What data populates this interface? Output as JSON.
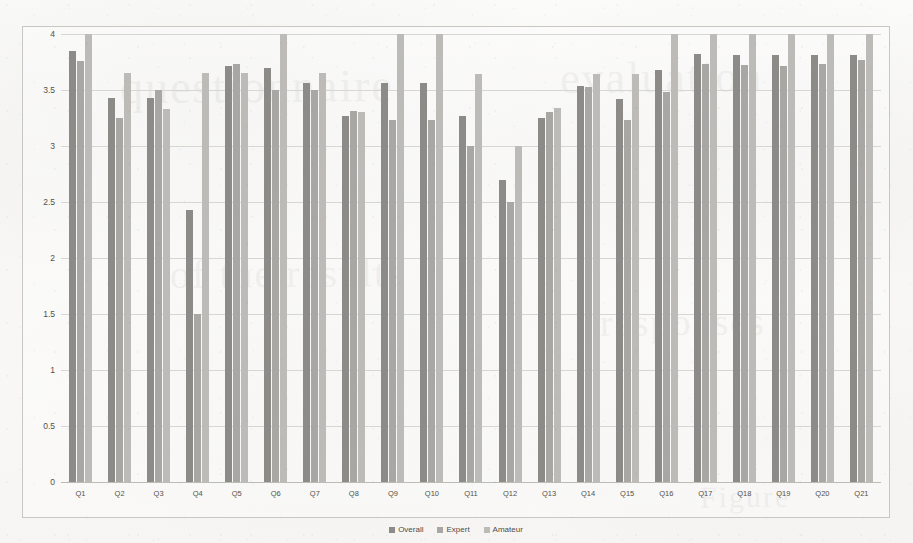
{
  "chart_data": {
    "type": "bar",
    "title": "",
    "xlabel": "",
    "ylabel": "",
    "ylim": [
      0,
      4
    ],
    "ytick_values": [
      0,
      0.5,
      1,
      1.5,
      2,
      2.5,
      3,
      3.5,
      4
    ],
    "ytick_labels": [
      "0",
      "0.5",
      "1",
      "1.5",
      "2",
      "2.5",
      "3",
      "3.5",
      "4"
    ],
    "grid": true,
    "legend_position": "bottom-center",
    "categories": [
      "Q1",
      "Q2",
      "Q3",
      "Q4",
      "Q5",
      "Q6",
      "Q7",
      "Q8",
      "Q9",
      "Q10",
      "Q11",
      "Q12",
      "Q13",
      "Q14",
      "Q15",
      "Q16",
      "Q17",
      "Q18",
      "Q19",
      "Q20",
      "Q21"
    ],
    "series": [
      {
        "name": "Overall",
        "color": "#8d8b88",
        "values": [
          3.85,
          3.43,
          3.43,
          2.43,
          3.71,
          3.7,
          3.56,
          3.27,
          3.56,
          3.56,
          3.27,
          2.7,
          3.25,
          3.54,
          3.42,
          3.68,
          3.82,
          3.81,
          3.81,
          3.81,
          3.81
        ]
      },
      {
        "name": "Expert",
        "color": "#a9a7a3",
        "values": [
          3.76,
          3.25,
          3.5,
          1.5,
          3.73,
          3.5,
          3.5,
          3.31,
          3.23,
          3.23,
          3.0,
          2.5,
          3.3,
          3.53,
          3.23,
          3.48,
          3.73,
          3.72,
          3.71,
          3.73,
          3.77
        ]
      },
      {
        "name": "Amateur",
        "color": "#bdbbb7",
        "values": [
          4.0,
          3.65,
          3.33,
          3.65,
          3.65,
          4.0,
          3.65,
          3.3,
          4.0,
          4.0,
          3.64,
          3.0,
          3.34,
          3.64,
          3.64,
          4.0,
          4.0,
          4.0,
          4.0,
          4.0,
          4.0
        ]
      }
    ]
  },
  "legend": {
    "items": [
      {
        "label": "Overall"
      },
      {
        "label": "Expert"
      },
      {
        "label": "Amateur"
      }
    ]
  },
  "bleed_through": [
    {
      "text": "questionnaire",
      "left": 120,
      "top": 60,
      "size": 46
    },
    {
      "text": "evaluation",
      "left": 560,
      "top": 52,
      "size": 44
    },
    {
      "text": "of the results",
      "left": 170,
      "top": 250,
      "size": 40
    },
    {
      "text": "responses",
      "left": 600,
      "top": 300,
      "size": 38
    },
    {
      "text": "Figure",
      "left": 700,
      "top": 480,
      "size": 30
    }
  ]
}
